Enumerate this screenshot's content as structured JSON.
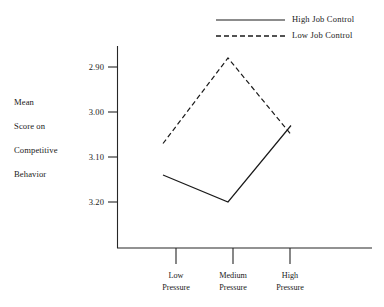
{
  "chart_data": {
    "type": "line",
    "title": "",
    "xlabel": "",
    "ylabel": "Mean Score on Competitive Behavior",
    "categories": [
      "Low Pressure",
      "Medium Pressure",
      "High Pressure"
    ],
    "yticks": [
      "2.90",
      "3.00",
      "3.10",
      "3.20"
    ],
    "ytick_values": [
      2.9,
      3.0,
      3.1,
      3.2
    ],
    "ylim": [
      2.85,
      3.24
    ],
    "y_axis_inverted": true,
    "grid": false,
    "legend_position": "top-right",
    "series": [
      {
        "name": "High Job Control",
        "style": "solid",
        "values": [
          3.14,
          3.2,
          3.03
        ]
      },
      {
        "name": "Low Job Control",
        "style": "dashed",
        "values": [
          3.07,
          2.88,
          3.05
        ]
      }
    ]
  },
  "legend": {
    "entries": [
      {
        "label": "High Job Control",
        "style": "solid"
      },
      {
        "label": "Low Job Control",
        "style": "dashed"
      }
    ]
  },
  "y_axis": {
    "label_lines": [
      "Mean",
      "Score on",
      "Competitive",
      "Behavior"
    ],
    "ticks": [
      "2.90",
      "3.00",
      "3.10",
      "3.20"
    ]
  },
  "x_axis": {
    "ticks": [
      {
        "line1": "Low",
        "line2": "Pressure"
      },
      {
        "line1": "Medium",
        "line2": "Pressure"
      },
      {
        "line1": "High",
        "line2": "Pressure"
      }
    ]
  },
  "colors": {
    "ink": "#1a1a1a",
    "axis": "#262626",
    "background": "#ffffff"
  }
}
